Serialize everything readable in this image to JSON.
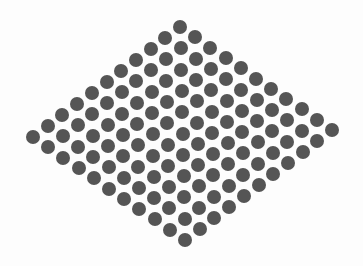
{
  "figure": {
    "background": "#fdfdfd",
    "dot_color": "#555555",
    "dot_diameter": 14,
    "grid": {
      "rows": 11,
      "cols": 11,
      "total_dots": 121,
      "origin_top": [
        180,
        27
      ],
      "step_u": [
        15.2,
        10.3
      ],
      "step_v": [
        -14.7,
        11.0
      ]
    },
    "corners": {
      "top": [
        180,
        27
      ],
      "right": [
        332,
        130
      ],
      "left": [
        33,
        137
      ],
      "bottom": [
        186,
        238
      ]
    }
  }
}
